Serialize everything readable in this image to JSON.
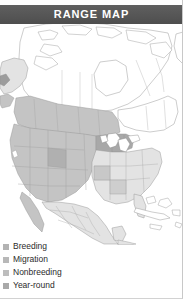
{
  "header": {
    "title": "RANGE MAP",
    "band_color": "#565656",
    "text_color": "#ffffff"
  },
  "map": {
    "region": "North America",
    "background_color": "#ffffff",
    "border_color": "#9a9a9a",
    "shade_colors": {
      "none": "#ffffff",
      "light": "#e3e3e3",
      "medium": "#c4c4c4",
      "dark": "#a8a8a8",
      "water": "#ffffff"
    },
    "areas": [
      {
        "name": "northern-canada",
        "shade": "none"
      },
      {
        "name": "alaska",
        "shade": "light"
      },
      {
        "name": "western-canada-prairie",
        "shade": "medium"
      },
      {
        "name": "eastern-canada",
        "shade": "none"
      },
      {
        "name": "western-united-states",
        "shade": "medium"
      },
      {
        "name": "upper-midwest",
        "shade": "dark"
      },
      {
        "name": "eastern-united-states",
        "shade": "light"
      },
      {
        "name": "mexico",
        "shade": "light"
      },
      {
        "name": "central-america",
        "shade": "light"
      },
      {
        "name": "caribbean-islands",
        "shade": "none"
      },
      {
        "name": "great-lakes",
        "shade": "water"
      }
    ]
  },
  "legend": {
    "items": [
      {
        "label": "Breeding",
        "color": "#b3b3b3"
      },
      {
        "label": "Migration",
        "color": "#b8b8b8"
      },
      {
        "label": "Nonbreeding",
        "color": "#bdbdbd"
      },
      {
        "label": "Year-round",
        "color": "#a9a9a9"
      }
    ]
  }
}
